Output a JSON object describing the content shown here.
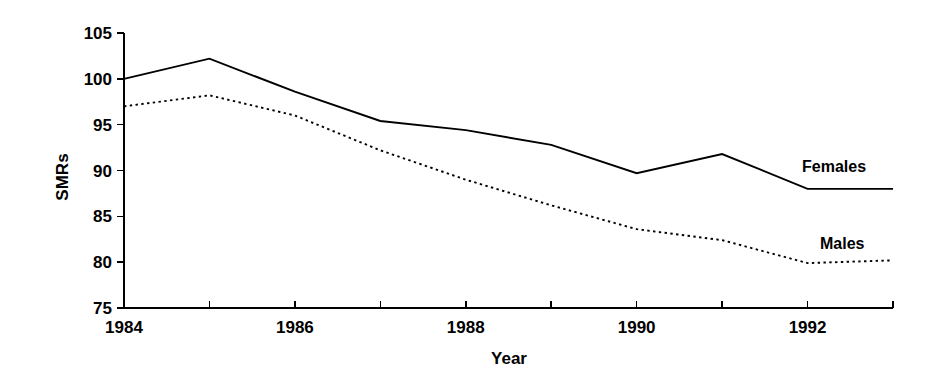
{
  "chart_data": {
    "type": "line",
    "title": "",
    "xlabel": "Year",
    "ylabel": "SMRs",
    "x": [
      1984,
      1985,
      1986,
      1987,
      1988,
      1989,
      1990,
      1991,
      1992,
      1993
    ],
    "xtick_values": [
      1984,
      1985,
      1986,
      1987,
      1988,
      1989,
      1990,
      1991,
      1992,
      1993
    ],
    "xtick_labels": [
      "1984",
      "",
      "1986",
      "",
      "1988",
      "",
      "1990",
      "",
      "1992",
      ""
    ],
    "xlim": [
      1984,
      1993
    ],
    "ytick_values": [
      75,
      80,
      85,
      90,
      95,
      100,
      105
    ],
    "ytick_labels": [
      "75",
      "80",
      "85",
      "90",
      "95",
      "100",
      "105"
    ],
    "ylim": [
      75,
      105
    ],
    "grid": false,
    "legend_position": "inline-right-annotations",
    "series": [
      {
        "name": "Females",
        "style": "solid",
        "color": "#000000",
        "label_text": "Females",
        "values": [
          100.0,
          102.2,
          98.6,
          95.4,
          94.4,
          92.8,
          89.7,
          91.8,
          88.0,
          88.0
        ]
      },
      {
        "name": "Males",
        "style": "dotted",
        "color": "#000000",
        "label_text": "Males",
        "values": [
          97.0,
          98.2,
          96.0,
          92.2,
          89.0,
          86.2,
          83.6,
          82.4,
          79.9,
          80.2
        ]
      }
    ],
    "annotations": [
      {
        "text": "Females",
        "series": "Females"
      },
      {
        "text": "Males",
        "series": "Males"
      }
    ]
  },
  "axes": {
    "y_axis_title": "SMRs",
    "x_axis_title": "Year"
  }
}
